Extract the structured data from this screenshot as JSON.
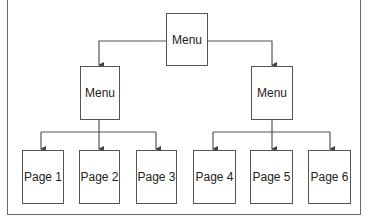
{
  "diagram": {
    "root": {
      "label": "Menu"
    },
    "submenus": [
      {
        "label": "Menu",
        "pages": [
          {
            "label": "Page 1"
          },
          {
            "label": "Page 2"
          },
          {
            "label": "Page 3"
          }
        ]
      },
      {
        "label": "Menu",
        "pages": [
          {
            "label": "Page 4"
          },
          {
            "label": "Page 5"
          },
          {
            "label": "Page 6"
          }
        ]
      }
    ],
    "colors": {
      "line": "#555555",
      "border": "#6a6a6a",
      "background": "#ffffff"
    }
  }
}
